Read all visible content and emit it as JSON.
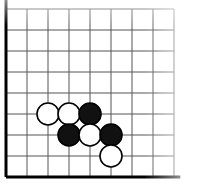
{
  "figure": {
    "name": "go-board-diagram",
    "kind": "goban",
    "width": 200,
    "height": 185,
    "background_color": "#ffffff"
  },
  "board": {
    "origin_x": 6,
    "origin_y": 9,
    "spacing": 21,
    "columns": 9,
    "rows": 9,
    "column_labels": [
      "A",
      "B",
      "C",
      "D",
      "E",
      "F",
      "G",
      "H",
      "J"
    ],
    "row_labels": [
      "9",
      "8",
      "7",
      "6",
      "5",
      "4",
      "3",
      "2",
      "1"
    ],
    "edges": {
      "left_edge_visible": true,
      "bottom_edge_visible": true,
      "top_edge_visible": false,
      "right_edge_visible": false
    },
    "line_color": "#545454",
    "edge_color": "#000000",
    "line_width": 1,
    "edge_width": 3,
    "fade_right": true,
    "fade_top": true
  },
  "stones": [
    {
      "id": "stone-1",
      "color": "white",
      "col": 2,
      "row": 5,
      "label": "",
      "coord": "C4"
    },
    {
      "id": "stone-2",
      "color": "white",
      "col": 3,
      "row": 5,
      "label": "",
      "coord": "D4"
    },
    {
      "id": "stone-3",
      "color": "black",
      "col": 4,
      "row": 5,
      "label": "",
      "coord": "E4"
    },
    {
      "id": "stone-4",
      "color": "black",
      "col": 3,
      "row": 6,
      "label": "",
      "coord": "D3"
    },
    {
      "id": "stone-5",
      "color": "white",
      "col": 4,
      "row": 6,
      "label": "",
      "coord": "E3"
    },
    {
      "id": "stone-6",
      "color": "black",
      "col": 5,
      "row": 6,
      "label": "",
      "coord": "F3"
    },
    {
      "id": "stone-7",
      "color": "white",
      "col": 5,
      "row": 7,
      "label": "",
      "coord": "F2"
    }
  ],
  "stone_style": {
    "radius": 11,
    "black_fill": "#111111",
    "black_stroke": "#000000",
    "white_fill": "#ffffff",
    "white_stroke": "#000000",
    "stroke_width": 1.6
  },
  "counts": {
    "black_stones": 4,
    "white_stones": 3,
    "total_stones": 7
  }
}
